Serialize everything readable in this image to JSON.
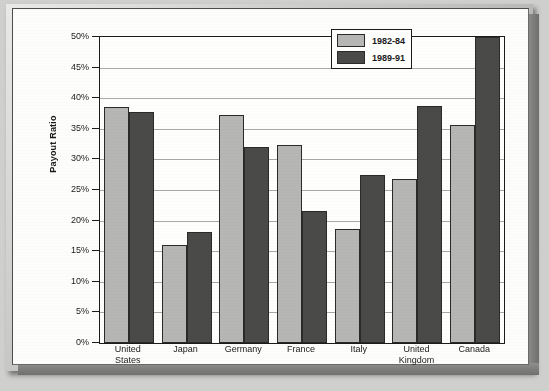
{
  "chart_data": {
    "type": "bar",
    "title": "",
    "xlabel": "",
    "ylabel": "Payout Ratio",
    "ylim": [
      0,
      50
    ],
    "ytick_labels": [
      "50%",
      "45%",
      "40%",
      "35%",
      "30%",
      "25%",
      "20%",
      "15%",
      "10%",
      "5%",
      "0%"
    ],
    "ytick_values": [
      50,
      45,
      40,
      35,
      30,
      25,
      20,
      15,
      10,
      5,
      0
    ],
    "grid": true,
    "legend_position": "top-right",
    "categories": [
      "United States",
      "Japan",
      "Germany",
      "France",
      "Italy",
      "United Kingdom",
      "Canada"
    ],
    "series": [
      {
        "name": "1982-84",
        "color": "#b6b6b4",
        "values": [
          38.6,
          16.0,
          37.3,
          32.4,
          18.6,
          26.8,
          35.6
        ]
      },
      {
        "name": "1989-91",
        "color": "#4a4a48",
        "values": [
          37.8,
          18.2,
          32.1,
          21.5,
          27.5,
          38.7,
          50.5
        ]
      }
    ]
  },
  "axis": {
    "y_label": "Payout Ratio"
  },
  "legend": {
    "items": [
      {
        "label": "1982-84",
        "swatch": "light-gray-swatch"
      },
      {
        "label": "1989-91",
        "swatch": "dark-gray-swatch"
      }
    ]
  },
  "xaxis": {
    "labels": [
      {
        "line1": "United",
        "line2": "States"
      },
      {
        "line1": "Japan",
        "line2": ""
      },
      {
        "line1": "Germany",
        "line2": ""
      },
      {
        "line1": "France",
        "line2": ""
      },
      {
        "line1": "Italy",
        "line2": ""
      },
      {
        "line1": "United",
        "line2": "Kingdom"
      },
      {
        "line1": "Canada",
        "line2": ""
      }
    ]
  }
}
